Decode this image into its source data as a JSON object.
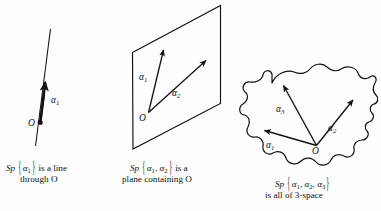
{
  "figure": {
    "background_color": "#fdfdfd",
    "stroke_color": "#111111",
    "width": 381,
    "height": 211
  },
  "panels": {
    "line": {
      "name": "span-one-vector-line",
      "origin_label": "O",
      "vector_labels": [
        {
          "text": "α",
          "sub": "1"
        }
      ],
      "caption_line1_prefix": "Sp",
      "caption_brace_open": "{",
      "caption_brace_close": "}",
      "caption_set": "α",
      "caption_set_sub": "1",
      "caption_line1_suffix": "is a line",
      "caption_line2": "through O"
    },
    "plane": {
      "name": "span-two-vectors-plane",
      "origin_label": "O",
      "vector_labels": [
        {
          "text": "α",
          "sub": "1"
        },
        {
          "text": "α",
          "sub": "2"
        }
      ],
      "caption_line1_prefix": "Sp",
      "caption_brace_open": "{",
      "caption_brace_close": "}",
      "caption_set_a": "α",
      "caption_set_a_sub": "1",
      "caption_set_b": "α",
      "caption_set_b_sub": "2",
      "caption_separator": ",",
      "caption_line1_suffix": "is a",
      "caption_line2": "plane containing O"
    },
    "space": {
      "name": "span-three-vectors-space",
      "origin_label": "O",
      "vector_labels": [
        {
          "text": "α",
          "sub": "1"
        },
        {
          "text": "α",
          "sub": "2"
        },
        {
          "text": "α",
          "sub": "3"
        }
      ],
      "caption_line1_prefix": "Sp",
      "caption_brace_open": "{",
      "caption_brace_close": "}",
      "caption_set_a": "α",
      "caption_set_a_sub": "1",
      "caption_set_b": "α",
      "caption_set_b_sub": "2",
      "caption_set_c": "α",
      "caption_set_c_sub": "3",
      "caption_separator": ",",
      "caption_line2": "is all of 3-space"
    }
  }
}
